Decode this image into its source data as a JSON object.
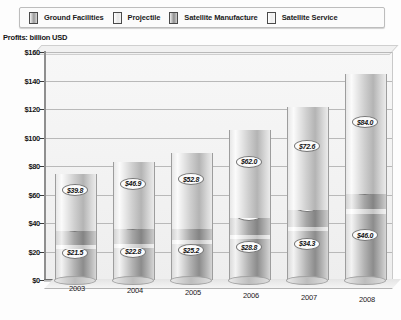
{
  "legend": {
    "items": [
      {
        "label": "Ground Facilities",
        "swatch": "legend-swatch-ground-facilities"
      },
      {
        "label": "Projectile",
        "swatch": "legend-swatch-projectile"
      },
      {
        "label": "Satellite Manufacture",
        "swatch": "legend-swatch-satellite-manufacture"
      },
      {
        "label": "Satellite Service",
        "swatch": "legend-swatch-satellite-service"
      }
    ]
  },
  "axis_title": "Profits: billion USD",
  "y_ticks": [
    "$160",
    "$140",
    "$120",
    "$100",
    "$80",
    "$60",
    "$40",
    "$20",
    "$0"
  ],
  "chart_data": {
    "type": "bar",
    "subtype": "stacked-3d-cylinder",
    "title": "Profits: billion USD",
    "xlabel": "",
    "ylabel": "Profits: billion USD",
    "ylim": [
      0,
      160
    ],
    "ytick_step": 20,
    "grid": true,
    "legend_position": "top",
    "categories": [
      "2003",
      "2004",
      "2005",
      "2006",
      "2007",
      "2008"
    ],
    "series": [
      {
        "name": "Ground Facilities",
        "values": [
          21.5,
          22.8,
          25.2,
          28.8,
          34.3,
          46.0
        ]
      },
      {
        "name": "Projectile",
        "values": [
          3.2,
          2.8,
          3.0,
          2.7,
          3.2,
          3.9
        ]
      },
      {
        "name": "Satellite Manufacture",
        "values": [
          9.8,
          10.2,
          7.8,
          12.0,
          11.6,
          10.5
        ]
      },
      {
        "name": "Satellite Service",
        "values": [
          39.8,
          46.9,
          52.8,
          62.0,
          72.6,
          84.0
        ]
      }
    ],
    "totals": [
      74.3,
      82.7,
      88.8,
      105.5,
      121.7,
      144.4
    ],
    "data_labels": [
      [
        "$21.5",
        "$3.2",
        "$9.8",
        "$39.8"
      ],
      [
        "$22.8",
        "$2.8",
        "$10.2",
        "$46.9"
      ],
      [
        "$25.2",
        "$3.0",
        "$7.8",
        "$52.8"
      ],
      [
        "$28.8",
        "$2.7",
        "$12.0",
        "$62.0"
      ],
      [
        "$34.3",
        "$3.2",
        "$11.6",
        "$72.6"
      ],
      [
        "$46.0",
        "$3.9",
        "$10.5",
        "$84.0"
      ]
    ]
  },
  "colors": {
    "plot_background": "#f2f2f2",
    "gridline": "#b9b9b9",
    "axis": "#6e6e6e",
    "text": "#141414"
  }
}
